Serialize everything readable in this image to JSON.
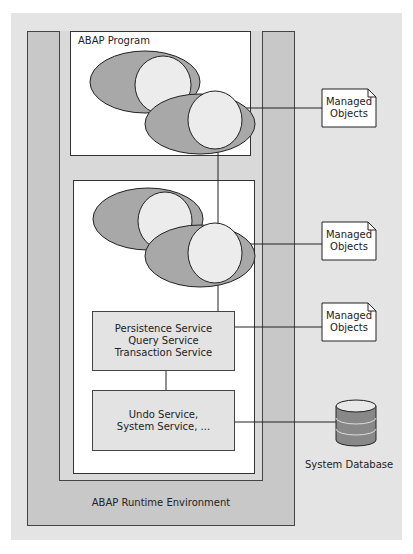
{
  "diagram": {
    "program_box": {
      "label": "ABAP Program"
    },
    "services": [
      {
        "lines": [
          "Persistence Service",
          "Query Service",
          "Transaction Service"
        ]
      },
      {
        "lines": [
          "Undo Service,",
          "System Service, ..."
        ]
      }
    ],
    "managed_objects": [
      {
        "lines": [
          "Managed",
          "Objects"
        ]
      },
      {
        "lines": [
          "Managed",
          "Objects"
        ]
      },
      {
        "lines": [
          "Managed",
          "Objects"
        ]
      }
    ],
    "database": {
      "label": "System Database"
    },
    "runtime": {
      "label": "ABAP Runtime Environment"
    }
  },
  "colors": {
    "background": "#e4e4e4",
    "runtime_frame": "#c8c8c8",
    "inner_panel": "#d9d9d9",
    "ellipse_dark": "#a8a8a8",
    "ellipse_light": "#ececec",
    "db": "#888888"
  }
}
